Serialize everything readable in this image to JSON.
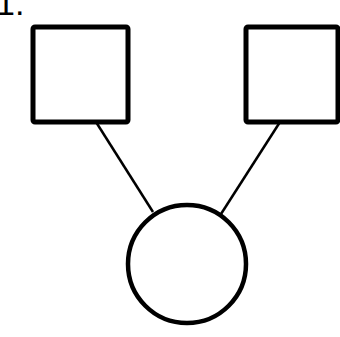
{
  "figure": {
    "label": "1.",
    "type": "pedigree",
    "stroke_color": "#000000",
    "fill_color": "#ffffff"
  },
  "nodes": [
    {
      "id": "father",
      "shape": "square",
      "sex": "male",
      "x": 33,
      "y": 27,
      "w": 95,
      "h": 95
    },
    {
      "id": "mother",
      "shape": "square",
      "sex": "male",
      "x": 246,
      "y": 27,
      "w": 92,
      "h": 95
    },
    {
      "id": "child",
      "shape": "circle",
      "sex": "female",
      "cx": 187,
      "cy": 264,
      "r": 59
    }
  ],
  "edges": [
    {
      "from": "father",
      "to": "child",
      "x1": 96,
      "y1": 122,
      "x2": 153,
      "y2": 212
    },
    {
      "from": "mother",
      "to": "child",
      "x1": 280,
      "y1": 122,
      "x2": 221,
      "y2": 214
    }
  ]
}
